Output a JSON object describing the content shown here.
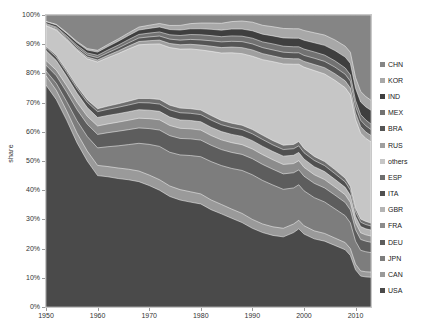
{
  "chart_data": {
    "type": "area",
    "stacked": true,
    "normalized": true,
    "title": "",
    "xlabel": "",
    "ylabel": "share",
    "xlim": [
      1950,
      2013
    ],
    "ylim": [
      0,
      100
    ],
    "grid": true,
    "legend_position": "right",
    "xticks": [
      1950,
      1960,
      1970,
      1980,
      1990,
      2000,
      2010
    ],
    "xtick_labels": [
      "1950",
      "1960",
      "1970",
      "1980",
      "1990",
      "2000",
      "2010"
    ],
    "yticks": [
      0,
      10,
      20,
      30,
      40,
      50,
      60,
      70,
      80,
      90,
      100
    ],
    "ytick_labels": [
      "0%",
      "10%",
      "20%",
      "30%",
      "40%",
      "50%",
      "60%",
      "70%",
      "80%",
      "90%",
      "100%"
    ],
    "x": [
      1950,
      1952,
      1954,
      1956,
      1958,
      1960,
      1962,
      1964,
      1966,
      1968,
      1970,
      1972,
      1974,
      1976,
      1978,
      1980,
      1982,
      1984,
      1986,
      1988,
      1990,
      1992,
      1994,
      1996,
      1998,
      1999,
      2000,
      2002,
      2004,
      2006,
      2008,
      2009,
      2010,
      2011,
      2012,
      2013
    ],
    "legend_order_top_to_bottom": [
      "CHN",
      "KOR",
      "IND",
      "MEX",
      "BRA",
      "RUS",
      "others",
      "ESP",
      "ITA",
      "GBR",
      "FRA",
      "DEU",
      "JPN",
      "CAN",
      "USA"
    ],
    "series": [
      {
        "name": "USA",
        "color": "#4a4a4a",
        "values": [
          76.0,
          71.0,
          64.0,
          56.0,
          50.0,
          45.0,
          44.6,
          44.0,
          43.4,
          42.5,
          41.6,
          40.0,
          38.0,
          37.0,
          36.5,
          36.0,
          34.0,
          32.6,
          31.0,
          29.5,
          27.5,
          26.0,
          25.0,
          24.5,
          26.0,
          27.3,
          25.5,
          23.8,
          23.0,
          21.5,
          20.0,
          18.0,
          13.0,
          10.8,
          10.5,
          10.4
        ]
      },
      {
        "name": "CAN",
        "color": "#9a9a9a",
        "values": [
          3.2,
          3.2,
          3.2,
          3.3,
          3.4,
          3.5,
          3.5,
          3.6,
          3.6,
          3.6,
          3.6,
          3.6,
          3.6,
          3.6,
          3.6,
          3.5,
          3.4,
          3.3,
          3.2,
          3.2,
          3.1,
          3.0,
          3.0,
          3.0,
          3.0,
          3.0,
          2.9,
          2.8,
          2.7,
          2.6,
          2.5,
          2.4,
          2.0,
          1.8,
          1.8,
          1.8
        ]
      },
      {
        "name": "JPN",
        "color": "#7d7d7d",
        "values": [
          1.6,
          2.4,
          3.2,
          4.2,
          5.0,
          6.0,
          6.8,
          7.6,
          8.4,
          9.4,
          10.5,
          11.4,
          11.6,
          12.0,
          12.6,
          13.0,
          13.4,
          13.6,
          14.2,
          15.0,
          15.6,
          15.2,
          14.6,
          13.6,
          12.6,
          12.4,
          12.2,
          11.6,
          11.0,
          10.2,
          9.4,
          9.0,
          8.0,
          7.2,
          7.0,
          6.8
        ]
      },
      {
        "name": "DEU",
        "color": "#5d5d5d",
        "values": [
          2.0,
          2.6,
          3.2,
          3.8,
          4.2,
          4.6,
          4.8,
          5.0,
          5.1,
          5.2,
          5.4,
          5.6,
          5.7,
          5.7,
          5.8,
          5.8,
          5.7,
          5.6,
          5.6,
          5.6,
          5.6,
          5.6,
          5.5,
          5.4,
          5.3,
          5.2,
          5.1,
          5.0,
          4.9,
          4.8,
          4.6,
          4.5,
          4.0,
          3.8,
          3.7,
          3.6
        ]
      },
      {
        "name": "FRA",
        "color": "#8c8c8c",
        "values": [
          1.6,
          1.9,
          2.2,
          2.5,
          2.7,
          2.9,
          3.0,
          3.1,
          3.2,
          3.3,
          3.4,
          3.5,
          3.5,
          3.5,
          3.5,
          3.5,
          3.4,
          3.4,
          3.4,
          3.4,
          3.4,
          3.4,
          3.3,
          3.3,
          3.2,
          3.2,
          3.1,
          3.0,
          2.9,
          2.8,
          2.7,
          2.6,
          2.4,
          2.3,
          2.2,
          2.2
        ]
      },
      {
        "name": "GBR",
        "color": "#b4b4b4",
        "values": [
          3.4,
          3.3,
          3.2,
          3.1,
          3.0,
          2.9,
          2.9,
          2.9,
          2.9,
          2.9,
          2.9,
          2.9,
          2.9,
          2.9,
          2.9,
          2.9,
          2.9,
          2.9,
          2.9,
          2.9,
          2.9,
          2.9,
          2.9,
          2.9,
          2.9,
          2.9,
          2.9,
          2.8,
          2.8,
          2.7,
          2.6,
          2.5,
          2.3,
          2.2,
          2.1,
          2.1
        ]
      },
      {
        "name": "ITA",
        "color": "#505050",
        "values": [
          1.0,
          1.2,
          1.4,
          1.6,
          1.8,
          2.0,
          2.1,
          2.2,
          2.3,
          2.4,
          2.5,
          2.5,
          2.5,
          2.5,
          2.5,
          2.5,
          2.5,
          2.4,
          2.4,
          2.4,
          2.4,
          2.4,
          2.3,
          2.3,
          2.3,
          2.3,
          2.2,
          2.2,
          2.1,
          2.0,
          1.9,
          1.8,
          1.6,
          1.5,
          1.5,
          1.4
        ]
      },
      {
        "name": "ESP",
        "color": "#6e6e6e",
        "values": [
          0.5,
          0.6,
          0.7,
          0.8,
          0.9,
          1.0,
          1.1,
          1.2,
          1.3,
          1.4,
          1.5,
          1.6,
          1.6,
          1.6,
          1.6,
          1.6,
          1.6,
          1.5,
          1.5,
          1.5,
          1.5,
          1.5,
          1.5,
          1.5,
          1.5,
          1.5,
          1.5,
          1.4,
          1.4,
          1.4,
          1.3,
          1.3,
          1.2,
          1.1,
          1.1,
          1.0
        ]
      },
      {
        "name": "others",
        "color": "#c6c6c6",
        "values": [
          7.0,
          8.6,
          10.4,
          12.2,
          14.0,
          16.0,
          16.6,
          17.2,
          17.8,
          18.2,
          18.6,
          19.0,
          19.8,
          20.4,
          20.8,
          21.0,
          22.4,
          23.6,
          24.6,
          25.0,
          25.6,
          26.4,
          27.6,
          28.4,
          28.0,
          27.0,
          28.4,
          30.0,
          30.6,
          31.2,
          31.6,
          32.0,
          31.0,
          30.0,
          29.0,
          28.4
        ]
      },
      {
        "name": "RUS",
        "color": "#9f9f9f",
        "values": [
          0.2,
          0.3,
          0.4,
          0.5,
          0.6,
          0.7,
          0.8,
          0.9,
          1.0,
          1.1,
          1.2,
          1.3,
          1.4,
          1.5,
          1.6,
          1.7,
          1.8,
          1.9,
          2.0,
          2.1,
          2.2,
          2.1,
          2.0,
          2.0,
          1.9,
          1.9,
          2.0,
          2.1,
          2.2,
          2.3,
          2.4,
          2.4,
          2.3,
          2.3,
          2.2,
          2.2
        ]
      },
      {
        "name": "BRA",
        "color": "#555555",
        "values": [
          0.3,
          0.4,
          0.5,
          0.6,
          0.7,
          0.8,
          0.9,
          1.0,
          1.1,
          1.2,
          1.3,
          1.4,
          1.5,
          1.6,
          1.7,
          1.8,
          1.9,
          2.0,
          2.0,
          2.1,
          2.1,
          2.1,
          2.1,
          2.1,
          2.1,
          2.1,
          2.1,
          2.2,
          2.2,
          2.3,
          2.3,
          2.4,
          2.3,
          2.2,
          2.2,
          2.1
        ]
      },
      {
        "name": "MEX",
        "color": "#727272",
        "values": [
          0.3,
          0.4,
          0.5,
          0.6,
          0.7,
          0.8,
          0.9,
          1.0,
          1.1,
          1.2,
          1.3,
          1.4,
          1.5,
          1.6,
          1.7,
          1.8,
          1.8,
          1.8,
          1.9,
          1.9,
          2.0,
          2.0,
          2.1,
          2.1,
          2.1,
          2.1,
          2.2,
          2.2,
          2.2,
          2.2,
          2.2,
          2.2,
          2.1,
          2.0,
          2.0,
          1.9
        ]
      },
      {
        "name": "IND",
        "color": "#3f3f3f",
        "values": [
          0.6,
          0.7,
          0.8,
          0.9,
          1.0,
          1.1,
          1.2,
          1.3,
          1.4,
          1.5,
          1.6,
          1.7,
          1.8,
          1.9,
          2.0,
          2.1,
          2.2,
          2.3,
          2.4,
          2.5,
          2.6,
          2.7,
          2.8,
          2.9,
          3.0,
          3.0,
          3.1,
          3.2,
          3.4,
          3.6,
          3.8,
          4.0,
          4.2,
          4.4,
          4.6,
          4.8
        ]
      },
      {
        "name": "KOR",
        "color": "#a8a8a8",
        "values": [
          0.1,
          0.2,
          0.3,
          0.4,
          0.5,
          0.6,
          0.7,
          0.8,
          0.9,
          1.0,
          1.1,
          1.2,
          1.4,
          1.6,
          1.8,
          2.0,
          2.2,
          2.4,
          2.6,
          2.8,
          3.0,
          3.1,
          3.2,
          3.3,
          3.3,
          3.3,
          3.4,
          3.5,
          3.6,
          3.7,
          3.8,
          3.9,
          3.8,
          3.7,
          3.6,
          3.5
        ]
      },
      {
        "name": "CHN",
        "color": "#858585",
        "values": [
          2.2,
          3.2,
          6.0,
          9.0,
          11.5,
          12.1,
          10.1,
          8.2,
          6.1,
          4.1,
          3.5,
          2.9,
          3.6,
          3.6,
          3.0,
          2.8,
          2.8,
          2.9,
          2.3,
          2.1,
          2.5,
          3.6,
          4.1,
          4.7,
          4.8,
          4.8,
          5.4,
          6.2,
          7.0,
          8.7,
          10.9,
          13.0,
          21.8,
          26.7,
          28.5,
          29.8
        ]
      }
    ]
  },
  "legend": {
    "items": [
      {
        "label": "CHN",
        "color": "#858585"
      },
      {
        "label": "KOR",
        "color": "#a8a8a8"
      },
      {
        "label": "IND",
        "color": "#3f3f3f"
      },
      {
        "label": "MEX",
        "color": "#727272"
      },
      {
        "label": "BRA",
        "color": "#555555"
      },
      {
        "label": "RUS",
        "color": "#9f9f9f"
      },
      {
        "label": "others",
        "color": "#c6c6c6"
      },
      {
        "label": "ESP",
        "color": "#6e6e6e"
      },
      {
        "label": "ITA",
        "color": "#505050"
      },
      {
        "label": "GBR",
        "color": "#b4b4b4"
      },
      {
        "label": "FRA",
        "color": "#8c8c8c"
      },
      {
        "label": "DEU",
        "color": "#5d5d5d"
      },
      {
        "label": "JPN",
        "color": "#7d7d7d"
      },
      {
        "label": "CAN",
        "color": "#9a9a9a"
      },
      {
        "label": "USA",
        "color": "#4a4a4a"
      }
    ]
  },
  "axes": {
    "y_axis_title": "share",
    "y_tick_labels": [
      "100%",
      "90%",
      "80%",
      "70%",
      "60%",
      "50%",
      "40%",
      "30%",
      "20%",
      "10%",
      "0%"
    ],
    "x_tick_labels": [
      "1950",
      "1960",
      "1970",
      "1980",
      "1990",
      "2000",
      "2010"
    ]
  }
}
